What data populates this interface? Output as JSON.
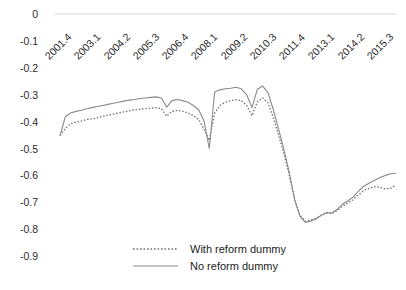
{
  "chart_data": {
    "type": "line",
    "title": "",
    "subtitle": "",
    "xlabel": "",
    "ylabel": "",
    "ylim": [
      -0.9,
      0.0
    ],
    "ytick_labels": [
      "0",
      "-0.1",
      "-0.2",
      "-0.3",
      "-0.4",
      "-0.5",
      "-0.6",
      "-0.7",
      "-0.8",
      "-0.9"
    ],
    "ytick_values": [
      0,
      -0.1,
      -0.2,
      -0.3,
      -0.4,
      -0.5,
      -0.6,
      -0.7,
      -0.8,
      -0.9
    ],
    "xtick_labels": [
      "2001.4",
      "2003.1",
      "2004.2",
      "2005.3",
      "2006.4",
      "2008.1",
      "2009.2",
      "2010.3",
      "2011.4",
      "2013.1",
      "2014.2",
      "2015.3"
    ],
    "grid": "y-zero-line-only",
    "legend_position": "bottom-center",
    "x_index": [
      0,
      1,
      2,
      3,
      4,
      5,
      6,
      7,
      8,
      9,
      10,
      11,
      12,
      13,
      14,
      15,
      16,
      17,
      18,
      19,
      20,
      21,
      22,
      23,
      24,
      25,
      26,
      27,
      28,
      29,
      30,
      31,
      32,
      33,
      34,
      35,
      36,
      37,
      38,
      39,
      40,
      41,
      42,
      43,
      44,
      45,
      46,
      47,
      48,
      49,
      50,
      51,
      52,
      53,
      54,
      55,
      56,
      57,
      58,
      59,
      60,
      61,
      62,
      63
    ],
    "series": [
      {
        "name": "With reform dummy",
        "style": "dotted",
        "color": "#6f6f6f",
        "values": [
          -0.452,
          -0.425,
          -0.408,
          -0.402,
          -0.398,
          -0.392,
          -0.39,
          -0.386,
          -0.38,
          -0.376,
          -0.372,
          -0.368,
          -0.364,
          -0.36,
          -0.356,
          -0.354,
          -0.352,
          -0.35,
          -0.348,
          -0.352,
          -0.38,
          -0.362,
          -0.358,
          -0.362,
          -0.368,
          -0.378,
          -0.392,
          -0.428,
          -0.47,
          -0.368,
          -0.34,
          -0.328,
          -0.322,
          -0.318,
          -0.322,
          -0.34,
          -0.378,
          -0.326,
          -0.312,
          -0.33,
          -0.386,
          -0.452,
          -0.52,
          -0.6,
          -0.69,
          -0.748,
          -0.77,
          -0.766,
          -0.76,
          -0.748,
          -0.74,
          -0.742,
          -0.73,
          -0.714,
          -0.702,
          -0.69,
          -0.672,
          -0.656,
          -0.648,
          -0.642,
          -0.644,
          -0.65,
          -0.648,
          -0.636
        ]
      },
      {
        "name": "No reform dummy",
        "style": "solid",
        "color": "#8a8a8a",
        "values": [
          -0.452,
          -0.382,
          -0.368,
          -0.362,
          -0.358,
          -0.352,
          -0.348,
          -0.344,
          -0.34,
          -0.336,
          -0.332,
          -0.328,
          -0.324,
          -0.32,
          -0.318,
          -0.314,
          -0.312,
          -0.31,
          -0.308,
          -0.312,
          -0.346,
          -0.322,
          -0.318,
          -0.322,
          -0.328,
          -0.34,
          -0.356,
          -0.398,
          -0.5,
          -0.29,
          -0.282,
          -0.278,
          -0.276,
          -0.272,
          -0.278,
          -0.3,
          -0.348,
          -0.28,
          -0.268,
          -0.292,
          -0.356,
          -0.43,
          -0.505,
          -0.59,
          -0.69,
          -0.752,
          -0.775,
          -0.77,
          -0.762,
          -0.748,
          -0.738,
          -0.74,
          -0.726,
          -0.706,
          -0.694,
          -0.68,
          -0.658,
          -0.64,
          -0.628,
          -0.618,
          -0.608,
          -0.6,
          -0.594,
          -0.592
        ]
      }
    ]
  },
  "legend": {
    "entries": [
      {
        "label": "With reform dummy",
        "style": "dotted"
      },
      {
        "label": "No reform dummy",
        "style": "solid"
      }
    ]
  },
  "axes": {
    "y": {
      "labels": [
        "0",
        "-0.1",
        "-0.2",
        "-0.3",
        "-0.4",
        "-0.5",
        "-0.6",
        "-0.7",
        "-0.8",
        "-0.9"
      ]
    },
    "x": {
      "labels": [
        "2001.4",
        "2003.1",
        "2004.2",
        "2005.3",
        "2006.4",
        "2008.1",
        "2009.2",
        "2010.3",
        "2011.4",
        "2013.1",
        "2014.2",
        "2015.3"
      ]
    }
  },
  "colors": {
    "solid_series": "#8a8a8a",
    "dotted_series": "#6f6f6f",
    "gridline": "#e3e3e3",
    "text": "#2b2b2b",
    "background": "#ffffff"
  }
}
